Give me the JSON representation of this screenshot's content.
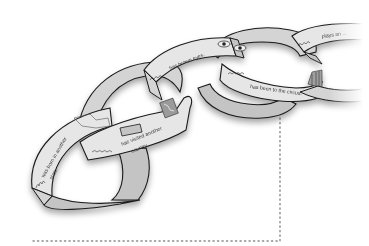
{
  "diagram": {
    "colors": {
      "band_fill": "#d4d4d4",
      "band_fill_light": "#e6e6e6",
      "inner_fill": "#c4c4c4",
      "outline": "#1a1a1a",
      "text": "#3a3a3a",
      "dotted_line": "#8a8a8a",
      "background": "#ffffff"
    },
    "links": [
      {
        "id": "link-1",
        "name_scribble": "Aiwa",
        "text_line1": "was born in another",
        "text_line2": "state.",
        "drawing": "state-map"
      },
      {
        "id": "link-2",
        "name_scribble": "Michael",
        "text_line1": "has visited another",
        "text_line2": "country.",
        "drawing": "country-map"
      },
      {
        "id": "link-3",
        "name_scribble": "Jordan",
        "text_line1": "has brown eyes.",
        "text_line2": "",
        "drawing": "two-eyes"
      },
      {
        "id": "link-4",
        "name_scribble": "Maya",
        "text_line1": "has been to the circus.",
        "text_line2": "",
        "drawing": "circus-tent"
      },
      {
        "id": "link-5",
        "name_scribble": "Ryan",
        "text_line1": "plays an ...",
        "text_line2": "",
        "drawing": "faded"
      }
    ],
    "guides": {
      "vertical_dotted": {
        "x": 280,
        "y1": 100,
        "y2": 241
      },
      "horizontal_dotted": {
        "y": 241,
        "x1": 33,
        "x2": 280
      }
    }
  }
}
